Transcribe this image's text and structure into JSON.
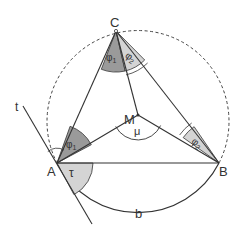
{
  "diagram": {
    "type": "geometry",
    "points": {
      "A": {
        "label": "A",
        "x": 57,
        "y": 163
      },
      "B": {
        "label": "B",
        "x": 219,
        "y": 163
      },
      "C": {
        "label": "C",
        "x": 116,
        "y": 31
      },
      "M": {
        "label": "M",
        "x": 138,
        "y": 115
      }
    },
    "circle": {
      "cx": 138,
      "cy": 115,
      "r": 91,
      "style": "dashed"
    },
    "labels": {
      "A": "A",
      "B": "B",
      "C": "C",
      "M": "M",
      "t": "t",
      "b": "b",
      "mu": "μ",
      "tau": "τ",
      "phi1_C": "φ",
      "phi1_C_sub": "1",
      "phi2_C": "φ",
      "phi2_C_sub": "2",
      "phi1_A": "φ",
      "phi1_A_sub": "1",
      "phi2_B": "φ",
      "phi2_B_sub": "2"
    },
    "colors": {
      "line": "#333333",
      "dark_fill": "#9a9a9a",
      "light_fill": "#d4d4d4",
      "background": "#ffffff"
    }
  }
}
